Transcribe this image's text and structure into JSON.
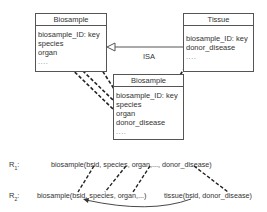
{
  "diagram": {
    "entities": [
      {
        "id": "biosample_source",
        "title": "Biosample",
        "attributes": [
          "biosample_ID: key",
          "species",
          "organ",
          "...."
        ]
      },
      {
        "id": "tissue",
        "title": "Tissue",
        "attributes": [
          "biosample_ID: key",
          "donor_disease",
          "...."
        ]
      },
      {
        "id": "biosample_target",
        "title": "Biosample",
        "attributes": [
          "biosample_ID: key",
          "species",
          "organ",
          "donor_disease",
          "...."
        ]
      }
    ],
    "relationship": {
      "label": "ISA",
      "from": "tissue",
      "to": "biosample_source",
      "arrow": "hollow-triangle"
    },
    "mappings": [
      {
        "from": "biosample_source.biosample_ID",
        "to": "biosample_target.biosample_ID"
      },
      {
        "from": "biosample_source.species",
        "to": "biosample_target.species"
      },
      {
        "from": "biosample_source.organ",
        "to": "biosample_target.organ"
      },
      {
        "from": "tissue.donor_disease",
        "to": "biosample_target.donor_disease"
      }
    ]
  },
  "rules": {
    "r1": {
      "label_main": "R",
      "label_sub": "1",
      "label_suffix": ":",
      "text": "biosample(bsid, species, organ,..., donor_disease)"
    },
    "r2": {
      "label_main": "R",
      "label_sub": "2",
      "label_suffix": ":",
      "text": "biosample(bsid, species, organ,...)",
      "text2": "tissue(bsid, donor_disease)"
    }
  },
  "colors": {
    "line": "#333333",
    "border": "#555555",
    "background": "#ffffff"
  }
}
